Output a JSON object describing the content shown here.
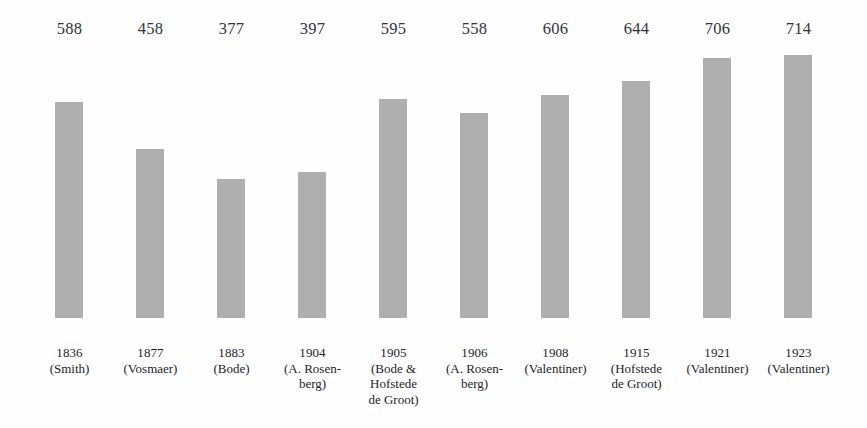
{
  "chart_data": {
    "type": "bar",
    "title": "",
    "subtitle": "",
    "xlabel": "",
    "ylabel": "",
    "grid": false,
    "legend": null,
    "ylim": [
      0,
      714
    ],
    "bar_color": "#afafaf",
    "background_color": "#fefefe",
    "categories": [
      "1836 (Smith)",
      "1877 (Vosmaer)",
      "1883 (Bode)",
      "1904 (A. Rosenberg)",
      "1905 (Bode & Hofstede de Groot)",
      "1906 (A. Rosenberg)",
      "1908 (Valentiner)",
      "1915 (Hofstede de Groot)",
      "1921 (Valentiner)",
      "1923 (Valentiner)"
    ],
    "values": [
      588,
      458,
      377,
      397,
      595,
      558,
      606,
      644,
      706,
      714
    ],
    "bars": [
      {
        "year": "1836",
        "source": "(Smith)",
        "value": 588,
        "value_label": "588"
      },
      {
        "year": "1877",
        "source": "(Vosmaer)",
        "value": 458,
        "value_label": "458"
      },
      {
        "year": "1883",
        "source": "(Bode)",
        "value": 377,
        "value_label": "377"
      },
      {
        "year": "1904",
        "source": "(A. Rosen-\nberg)",
        "value": 397,
        "value_label": "397"
      },
      {
        "year": "1905",
        "source": "(Bode &\nHofstede\nde Groot)",
        "value": 595,
        "value_label": "595"
      },
      {
        "year": "1906",
        "source": "(A. Rosen-\nberg)",
        "value": 558,
        "value_label": "558"
      },
      {
        "year": "1908",
        "source": "(Valentiner)",
        "value": 606,
        "value_label": "606"
      },
      {
        "year": "1915",
        "source": "(Hofstede\nde Groot)",
        "value": 644,
        "value_label": "644"
      },
      {
        "year": "1921",
        "source": "(Valentiner)",
        "value": 706,
        "value_label": "706"
      },
      {
        "year": "1923",
        "source": "(Valentiner)",
        "value": 714,
        "value_label": "714"
      }
    ]
  }
}
